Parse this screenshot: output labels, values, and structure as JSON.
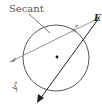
{
  "diagram": {
    "title_label": "Secant",
    "point_label": "E",
    "angle_labels": {
      "x": "x°",
      "y": "y°"
    },
    "colors": {
      "circle": "#444444",
      "secant": "#888888",
      "line": "#222222",
      "center_dot": "#111111"
    }
  }
}
